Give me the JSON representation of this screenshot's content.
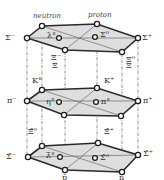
{
  "diagram": {
    "captions": {
      "neutron": "neutron",
      "proton": "proton"
    },
    "colors": {
      "plane": "#dedede",
      "edge": "#2a2a2a",
      "node_fill": "#ffffff"
    },
    "layers": [
      {
        "name": "baryon-octet",
        "nodes": [
          {
            "id": "sigma-minus",
            "label": "Σ⁻",
            "x": 27,
            "y": 38
          },
          {
            "id": "neutron",
            "label": "",
            "x": 42,
            "y": 26
          },
          {
            "id": "proton",
            "label": "",
            "x": 97,
            "y": 24
          },
          {
            "id": "sigma-plus",
            "label": "Σ⁺",
            "x": 138,
            "y": 38
          },
          {
            "id": "xi-minus",
            "label": "Ξ⁻",
            "x": 65,
            "y": 50
          },
          {
            "id": "xi-zero",
            "label": "Ξ⁰",
            "x": 122,
            "y": 52
          },
          {
            "id": "lambda-zero",
            "label": "Λ⁰",
            "x": 59,
            "y": 38
          },
          {
            "id": "sigma-zero",
            "label": "Σ⁰",
            "x": 95,
            "y": 37
          }
        ]
      },
      {
        "name": "meson-octet",
        "nodes": [
          {
            "id": "pi-minus",
            "label": "π⁻",
            "x": 27,
            "y": 101
          },
          {
            "id": "k-zero",
            "label": "K⁰",
            "x": 42,
            "y": 90
          },
          {
            "id": "k-plus",
            "label": "K⁺",
            "x": 97,
            "y": 88
          },
          {
            "id": "pi-plus",
            "label": "π⁺",
            "x": 138,
            "y": 101
          },
          {
            "id": "k-minus",
            "label": "",
            "x": 64,
            "y": 115
          },
          {
            "id": "k-zero-bar",
            "label": "",
            "x": 121,
            "y": 116
          },
          {
            "id": "eta-zero",
            "label": "η⁰",
            "x": 59,
            "y": 102
          },
          {
            "id": "pi-zero",
            "label": "π⁰",
            "x": 96,
            "y": 102
          }
        ]
      },
      {
        "name": "antibaryon-octet",
        "nodes": [
          {
            "id": "anti-sigma-minus",
            "label": "Σ̄⁻",
            "x": 28,
            "y": 157
          },
          {
            "id": "anti-xi-zero",
            "label": "Ξ̄⁰",
            "x": 42,
            "y": 146
          },
          {
            "id": "anti-xi-plus",
            "label": "Ξ̄⁺",
            "x": 98,
            "y": 143
          },
          {
            "id": "anti-sigma-plus",
            "label": "Σ̄⁺",
            "x": 138,
            "y": 155
          },
          {
            "id": "anti-proton",
            "label": "p̄",
            "x": 65,
            "y": 170
          },
          {
            "id": "anti-neutron",
            "label": "n̄",
            "x": 122,
            "y": 172
          },
          {
            "id": "anti-lambda-zero",
            "label": "Λ̄⁰",
            "x": 60,
            "y": 157
          },
          {
            "id": "anti-sigma-zero",
            "label": "Σ̄⁰",
            "x": 95,
            "y": 158
          }
        ]
      }
    ],
    "labels": {
      "sigma_minus": "Σ⁻",
      "sigma_plus": "Σ⁺",
      "lambda0": "λ°",
      "sigma0": "Σ⁰",
      "xi_minus": "Ξ⁻",
      "xi0": "Ξ⁰",
      "pi_minus": "π⁻",
      "pi_plus": "π⁺",
      "k0": "K°",
      "k_plus": "K⁺",
      "eta0": "η°",
      "pi0": "π°",
      "k_minus_bar": "Ξ",
      "k0_bar": "Ξ",
      "anti_sigma_minus": "Σ̄⁻",
      "anti_sigma_plus": "Σ̄⁺",
      "anti_xi0": "Ξ̄⁰",
      "anti_xi_plus": "Ξ̄⁺",
      "anti_lambda0": "λ̄°",
      "anti_sigma0": "Σ̄⁰",
      "anti_proton": "p̄",
      "anti_neutron": "n̄"
    }
  }
}
